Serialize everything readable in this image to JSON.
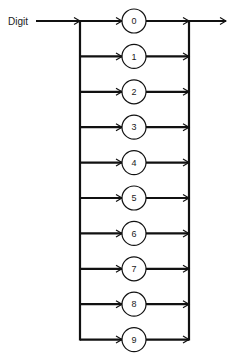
{
  "diagram": {
    "type": "syntax-diagram",
    "input_label": "Digit",
    "nodes": [
      "0",
      "1",
      "2",
      "3",
      "4",
      "5",
      "6",
      "7",
      "8",
      "9"
    ]
  }
}
